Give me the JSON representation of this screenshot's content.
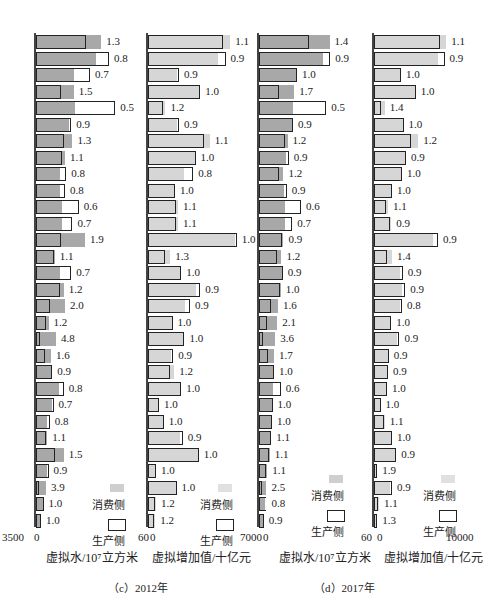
{
  "header_text": "",
  "colors": {
    "water_consumption_fill": "#a8a8a8",
    "water_production_fill": "#8f8f8f",
    "value_consumption_fill": "#d6d6d6",
    "value_production_fill": "#dcdcdc",
    "outline": "#222222"
  },
  "legend": {
    "consumption_label": "消费侧",
    "production_label": "生产侧"
  },
  "captions": {
    "c": "（c）2012年",
    "d": "（d）2017年"
  },
  "chart_data": [
    {
      "type": "bar",
      "orientation": "horizontal",
      "panel": "c",
      "year": "2012",
      "metric": "water",
      "xlabel": "虚拟水/10⁷立方米",
      "xlim": [
        0,
        3500
      ],
      "tick_labels": [
        "3500",
        "0"
      ],
      "series": [
        {
          "name": "消费侧",
          "values": [
            2600,
            2400,
            1500,
            1500,
            1550,
            1300,
            1450,
            1150,
            950,
            950,
            1050,
            1050,
            1950,
            750,
            950,
            1100,
            1150,
            500,
            800,
            600,
            650,
            900,
            650,
            450,
            450,
            1100,
            450,
            400,
            300,
            200
          ]
        },
        {
          "name": "生产侧",
          "values": [
            2000,
            2900,
            2150,
            1000,
            3150,
            1400,
            1100,
            1050,
            1200,
            1150,
            1700,
            1450,
            1000,
            700,
            1400,
            950,
            550,
            400,
            170,
            370,
            650,
            1100,
            700,
            550,
            400,
            750,
            500,
            100,
            300,
            200
          ]
        }
      ],
      "ratio_labels": [
        "1.3",
        "0.8",
        "0.7",
        "1.5",
        "0.5",
        "0.9",
        "1.3",
        "1.1",
        "0.8",
        "0.8",
        "0.6",
        "0.7",
        "1.9",
        "1.1",
        "0.7",
        "1.2",
        "2.0",
        "1.2",
        "4.8",
        "1.6",
        "0.9",
        "0.8",
        "0.7",
        "0.8",
        "1.1",
        "1.5",
        "0.9",
        "3.9",
        "1.0",
        "1.0"
      ]
    },
    {
      "type": "bar",
      "orientation": "horizontal",
      "panel": "c",
      "year": "2012",
      "metric": "value_added",
      "xlabel": "虚拟增加值/十亿元",
      "xlim": [
        0,
        6000
      ],
      "tick_labels": [
        "60",
        "0"
      ],
      "series": [
        {
          "name": "消费侧",
          "values": [
            5200,
            4400,
            1800,
            3300,
            1100,
            1850,
            3900,
            3000,
            2300,
            1700,
            1900,
            1900,
            5500,
            1400,
            2100,
            3000,
            2350,
            1550,
            2300,
            1450,
            1650,
            2100,
            700,
            1000,
            2000,
            3200,
            500,
            1800,
            500,
            450
          ]
        },
        {
          "name": "生产侧",
          "values": [
            4750,
            4900,
            1950,
            3300,
            950,
            1950,
            3550,
            3000,
            2850,
            1700,
            1750,
            1750,
            5600,
            1100,
            2100,
            3300,
            2650,
            1550,
            2300,
            1600,
            1400,
            2100,
            700,
            1000,
            2200,
            3200,
            500,
            1800,
            450,
            400
          ]
        }
      ],
      "ratio_labels": [
        "1.1",
        "0.9",
        "0.9",
        "1.0",
        "1.2",
        "0.9",
        "1.1",
        "1.0",
        "0.8",
        "1.0",
        "1.1",
        "1.1",
        "1.0",
        "1.3",
        "1.0",
        "0.9",
        "0.9",
        "1.0",
        "1.0",
        "0.9",
        "1.2",
        "1.0",
        "1.0",
        "1.0",
        "0.9",
        "1.0",
        "1.0",
        "1.0",
        "1.2",
        "1.2"
      ]
    },
    {
      "type": "bar",
      "orientation": "horizontal",
      "panel": "d",
      "year": "2017",
      "metric": "water",
      "xlabel": "虚拟水/10⁷立方米",
      "xlim": [
        0,
        7000
      ],
      "tick_labels": [
        "7000",
        "0"
      ],
      "series": [
        {
          "name": "消费侧",
          "values": [
            5200,
            4700,
            2800,
            2600,
            2500,
            2500,
            2100,
            2000,
            1800,
            1850,
            1900,
            1900,
            1800,
            1650,
            1700,
            1600,
            1400,
            1350,
            1200,
            1100,
            1100,
            1000,
            1000,
            900,
            900,
            800,
            600,
            550,
            450,
            300
          ]
        },
        {
          "name": "生产侧",
          "values": [
            3700,
            5250,
            2800,
            1500,
            4950,
            2500,
            1950,
            2200,
            1500,
            2050,
            3100,
            2450,
            1700,
            1300,
            1750,
            1550,
            900,
            600,
            300,
            650,
            1100,
            1600,
            1000,
            950,
            850,
            700,
            550,
            200,
            550,
            350
          ]
        }
      ],
      "ratio_labels": [
        "1.4",
        "0.9",
        "1.0",
        "1.7",
        "0.5",
        "0.9",
        "1.2",
        "0.9",
        "1.2",
        "0.9",
        "0.6",
        "0.7",
        "0.9",
        "1.2",
        "0.9",
        "1.0",
        "1.6",
        "2.1",
        "3.6",
        "1.7",
        "1.0",
        "0.6",
        "1.0",
        "1.0",
        "1.1",
        "1.1",
        "1.1",
        "2.5",
        "0.8",
        "0.9"
      ]
    },
    {
      "type": "bar",
      "orientation": "horizontal",
      "panel": "d",
      "year": "2017",
      "metric": "value_added",
      "xlabel": "虚拟增加值/十亿元",
      "xlim": [
        0,
        10000
      ],
      "tick_labels": [
        "60",
        "0",
        "10000"
      ],
      "series": [
        {
          "name": "消费侧",
          "values": [
            8800,
            7800,
            3300,
            5100,
            1300,
            3600,
            5400,
            3900,
            3400,
            2200,
            1700,
            2100,
            7200,
            2200,
            3200,
            3400,
            3200,
            2100,
            2800,
            1700,
            1600,
            1600,
            800,
            1300,
            2200,
            2600,
            400,
            2000,
            600,
            400
          ]
        },
        {
          "name": "生产侧",
          "values": [
            8100,
            8600,
            3300,
            5100,
            900,
            3600,
            4500,
            3900,
            3400,
            2200,
            1500,
            1900,
            7800,
            1600,
            3500,
            3800,
            3400,
            2100,
            3100,
            1800,
            1700,
            1600,
            800,
            1200,
            2200,
            2700,
            200,
            2200,
            500,
            300
          ]
        }
      ],
      "ratio_labels": [
        "1.1",
        "0.9",
        "1.0",
        "1.0",
        "1.4",
        "1.0",
        "1.2",
        "0.9",
        "1.0",
        "1.0",
        "1.1",
        "0.9",
        "0.9",
        "1.4",
        "0.9",
        "0.9",
        "0.8",
        "1.0",
        "0.9",
        "0.9",
        "0.9",
        "1.0",
        "1.0",
        "1.1",
        "1.0",
        "0.9",
        "1.9",
        "0.9",
        "1.1",
        "1.3"
      ]
    }
  ]
}
